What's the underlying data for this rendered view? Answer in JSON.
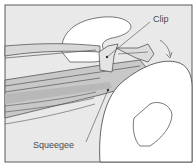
{
  "figure": {
    "type": "line-art illustration",
    "colors": {
      "background": "#e9e9e9",
      "frame": "#5a5a5a",
      "outline": "#555555",
      "hand_fill": "#ffffff",
      "blade_fill": "#c8c8c8",
      "blade_dark": "#b4b4b4"
    }
  },
  "labels": {
    "clip": "Clip",
    "squeegee": "Squeegee"
  }
}
